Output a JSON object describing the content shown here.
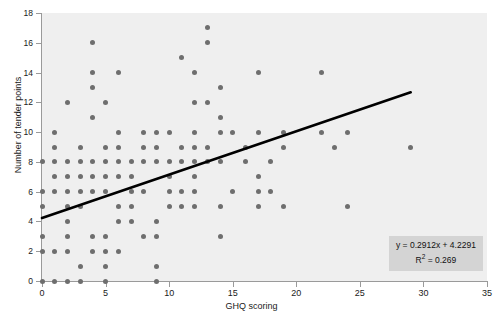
{
  "chart_data": {
    "type": "scatter",
    "title": "",
    "xlabel": "GHQ scoring",
    "ylabel": "Number of tender points",
    "xlim": [
      0,
      35
    ],
    "ylim": [
      0,
      18
    ],
    "xticks": [
      0,
      5,
      10,
      15,
      20,
      25,
      30,
      35
    ],
    "yticks": [
      0,
      2,
      4,
      6,
      8,
      10,
      12,
      14,
      16,
      18
    ],
    "grid": false,
    "legend_position": "bottom-right",
    "point_color": "#6e6e6e",
    "panel_color": "#efefef",
    "trendline_color": "#000000",
    "annotation": {
      "equation": "y = 0.2912x + 4.2291",
      "r_squared_label": "R",
      "r_squared_sup": "2",
      "r_squared_value": " = 0.269",
      "slope": 0.2912,
      "intercept": 4.2291,
      "r2": 0.269
    },
    "trendline": {
      "x0": 0,
      "y0": 4.2291,
      "x1": 29,
      "y1": 12.674
    },
    "points": [
      [
        0,
        0
      ],
      [
        1,
        0
      ],
      [
        2,
        0
      ],
      [
        3,
        0
      ],
      [
        5,
        0
      ],
      [
        9,
        0
      ],
      [
        3,
        1
      ],
      [
        5,
        1
      ],
      [
        9,
        1
      ],
      [
        0,
        2
      ],
      [
        1,
        2
      ],
      [
        2,
        2
      ],
      [
        4,
        2
      ],
      [
        5,
        2
      ],
      [
        6,
        2
      ],
      [
        0,
        3
      ],
      [
        2,
        3
      ],
      [
        4,
        3
      ],
      [
        5,
        3
      ],
      [
        8,
        3
      ],
      [
        9,
        3
      ],
      [
        14,
        3
      ],
      [
        2,
        4
      ],
      [
        6,
        4
      ],
      [
        7,
        4
      ],
      [
        9,
        4
      ],
      [
        0,
        5
      ],
      [
        2,
        5
      ],
      [
        3,
        5
      ],
      [
        6,
        5
      ],
      [
        7,
        5
      ],
      [
        10,
        5
      ],
      [
        11,
        5
      ],
      [
        12,
        5
      ],
      [
        14,
        5
      ],
      [
        17,
        5
      ],
      [
        19,
        5
      ],
      [
        24,
        5
      ],
      [
        0,
        6
      ],
      [
        1,
        6
      ],
      [
        2,
        6
      ],
      [
        3,
        6
      ],
      [
        4,
        6
      ],
      [
        5,
        6
      ],
      [
        7,
        6
      ],
      [
        8,
        6
      ],
      [
        10,
        6
      ],
      [
        11,
        6
      ],
      [
        12,
        6
      ],
      [
        15,
        6
      ],
      [
        17,
        6
      ],
      [
        18,
        6
      ],
      [
        1,
        7
      ],
      [
        2,
        7
      ],
      [
        3,
        7
      ],
      [
        4,
        7
      ],
      [
        5,
        7
      ],
      [
        6,
        7
      ],
      [
        7,
        7
      ],
      [
        10,
        7
      ],
      [
        12,
        7
      ],
      [
        17,
        7
      ],
      [
        0,
        8
      ],
      [
        1,
        8
      ],
      [
        2,
        8
      ],
      [
        3,
        8
      ],
      [
        4,
        8
      ],
      [
        5,
        8
      ],
      [
        6,
        8
      ],
      [
        7,
        8
      ],
      [
        8,
        8
      ],
      [
        9,
        8
      ],
      [
        10,
        8
      ],
      [
        11,
        8
      ],
      [
        12,
        8
      ],
      [
        13,
        8
      ],
      [
        14,
        8
      ],
      [
        16,
        8
      ],
      [
        18,
        8
      ],
      [
        1,
        9
      ],
      [
        3,
        9
      ],
      [
        5,
        9
      ],
      [
        6,
        9
      ],
      [
        8,
        9
      ],
      [
        9,
        9
      ],
      [
        11,
        9
      ],
      [
        12,
        9
      ],
      [
        13,
        9
      ],
      [
        16,
        9
      ],
      [
        19,
        9
      ],
      [
        23,
        9
      ],
      [
        29,
        9
      ],
      [
        1,
        10
      ],
      [
        6,
        10
      ],
      [
        8,
        10
      ],
      [
        9,
        10
      ],
      [
        10,
        10
      ],
      [
        12,
        10
      ],
      [
        14,
        10
      ],
      [
        15,
        10
      ],
      [
        17,
        10
      ],
      [
        19,
        10
      ],
      [
        22,
        10
      ],
      [
        24,
        10
      ],
      [
        4,
        11
      ],
      [
        14,
        11
      ],
      [
        2,
        12
      ],
      [
        5,
        12
      ],
      [
        12,
        12
      ],
      [
        13,
        12
      ],
      [
        4,
        13
      ],
      [
        14,
        13
      ],
      [
        4,
        14
      ],
      [
        6,
        14
      ],
      [
        12,
        14
      ],
      [
        17,
        14
      ],
      [
        22,
        14
      ],
      [
        11,
        15
      ],
      [
        4,
        16
      ],
      [
        13,
        16
      ],
      [
        13,
        17
      ]
    ]
  }
}
